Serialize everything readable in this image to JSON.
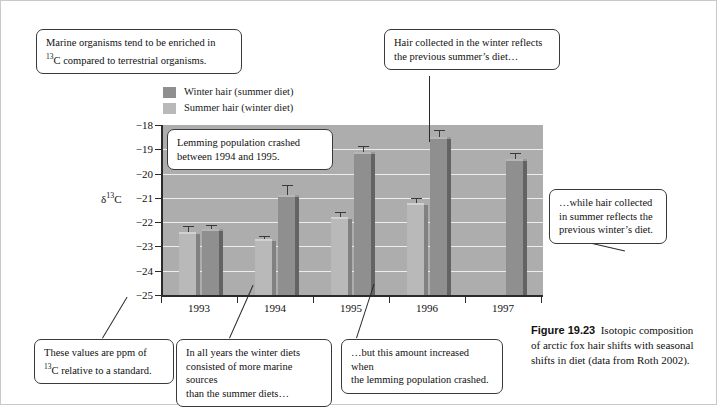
{
  "chart_data": {
    "type": "bar",
    "title": "",
    "xlabel": "",
    "ylabel": "δ¹³C",
    "ylim": [
      -25,
      -18
    ],
    "y_ticks": [
      "-18",
      "-19",
      "-20",
      "-21",
      "-22",
      "-23",
      "-24",
      "-25"
    ],
    "categories": [
      "1993",
      "1994",
      "1995",
      "1996",
      "1997"
    ],
    "grid": true,
    "legend_position": "above-left",
    "series": [
      {
        "name": "Summer hair (winter diet)",
        "color": "#b9b9b9",
        "values": [
          -22.4,
          -22.7,
          -21.8,
          -21.2,
          null
        ],
        "errors": [
          0.25,
          0.12,
          0.22,
          0.18,
          null
        ]
      },
      {
        "name": "Winter hair (summer diet)",
        "color": "#8f8f8f",
        "values": [
          -22.3,
          -20.9,
          -19.1,
          -18.5,
          -19.4
        ],
        "errors": [
          0.2,
          0.45,
          0.25,
          0.3,
          0.25
        ]
      }
    ]
  },
  "legend": {
    "items": [
      {
        "label": "Winter hair (summer diet)",
        "color": "#8f8f8f"
      },
      {
        "label": "Summer hair (winter diet)",
        "color": "#b9b9b9"
      }
    ]
  },
  "axis": {
    "y_title_main": "δ",
    "y_title_sup": "13",
    "y_title_tail": "C"
  },
  "callouts": [
    {
      "id": "marine-organisms",
      "line1": "Marine organisms tend to be enriched in",
      "line2_pre": "",
      "line2_sup": "13",
      "line2_post": "C compared to terrestrial organisms."
    },
    {
      "id": "winter-hair-note",
      "line1": "Hair collected in the winter reflects",
      "line2": "the previous summer’s diet…"
    },
    {
      "id": "lemming-crash",
      "line1": "Lemming population crashed",
      "line2": "between 1994 and 1995."
    },
    {
      "id": "summer-hair-note",
      "line1": "…while hair collected",
      "line2": "in summer reflects the",
      "line3": "previous winter’s diet."
    },
    {
      "id": "ppm-note",
      "line1": "These values are ppm of",
      "line2_sup": "13",
      "line2_post": "C relative to a standard."
    },
    {
      "id": "marine-sources",
      "line1": "In all years the winter diets",
      "line2": "consisted of more marine sources",
      "line3": "than the summer diets…"
    },
    {
      "id": "amount-increased",
      "line1": "…but this amount increased when",
      "line2": "the lemming population crashed."
    }
  ],
  "caption": {
    "figure_number": "Figure 19.23",
    "text": "Isotopic composition of arctic fox hair shifts with seasonal shifts in diet (data from Roth 2002)."
  }
}
